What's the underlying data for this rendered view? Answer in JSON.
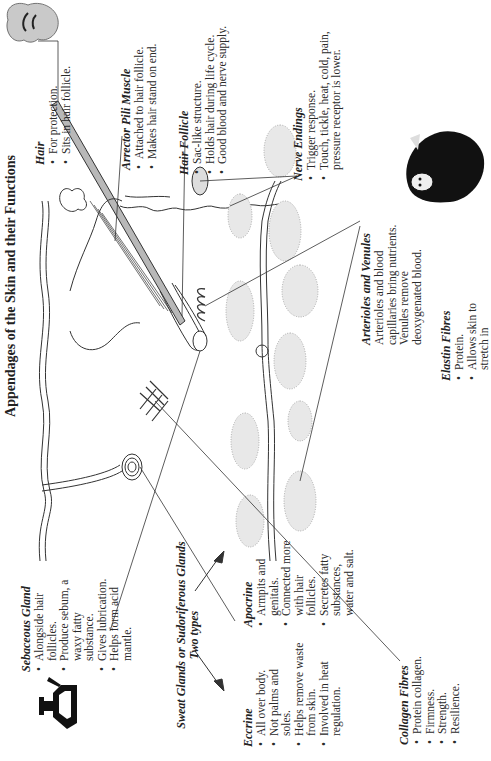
{
  "title": "Appendages of the Skin and their Functions",
  "labels": {
    "hair": {
      "heading": "Hair",
      "bullets": [
        "For protection.",
        "Sits in hair follicle."
      ]
    },
    "arrector_pili": {
      "heading": "Arrector Pili Muscle",
      "bullets": [
        "Attached to hair follicle.",
        "Makes hair stand on end."
      ]
    },
    "hair_follicle": {
      "heading": "Hair Follicle",
      "bullets": [
        "Sac-like structure.",
        "Holds hair during life cycle.",
        "Good blood and nerve supply."
      ]
    },
    "nerve_endings": {
      "heading": "Nerve Endings",
      "bullets": [
        "Trigger response.",
        "Touch, tickle, heat, cold, pain, pressure receptor is lower."
      ]
    },
    "arterioles": {
      "heading": "Arterioles and Venules",
      "text": "Arterioles and blood capillaries bring nutrients. Venules remove deoxygenated blood."
    },
    "elastin": {
      "heading": "Elastin Fibres",
      "bullets": [
        "Protein.",
        "Allows skin to stretch in"
      ]
    },
    "collagen": {
      "heading": "Collagen Fibres",
      "bullets": [
        "Protein collagen.",
        "Firmness.",
        "Strength.",
        "Resilience."
      ]
    },
    "sebaceous": {
      "heading": "Sebaceous Gland",
      "bullets": [
        "Alongside hair follicles.",
        "Produce sebum, a waxy fatty substance.",
        "Gives lubrication.",
        "Helps form acid mantle."
      ]
    },
    "sweat": {
      "heading": "Sweat Glands or Sudoriferous Glands",
      "subheading": "Two types"
    },
    "eccrine": {
      "heading": "Eccrine",
      "bullets": [
        "All over body.",
        "Not palms and soles.",
        "Helps remove waste from skin.",
        "Involved in heat regulation."
      ]
    },
    "apocrine": {
      "heading": "Apocrine",
      "bullets": [
        "Armpits and genitals.",
        "Connected more with hair follicles.",
        "Secretes fatty substances, water and salt."
      ]
    }
  },
  "icons": {
    "hair_illustration": "woman-hair-icon",
    "dark_figure": "cloaked-figure-icon",
    "sebaceous_icon": "oil-can-icon"
  },
  "colors": {
    "line": "#333333",
    "hair_fill": "#b8b8b8",
    "stipple": "#9a9a9a",
    "hair_icon_fill": "#c9c9c9"
  }
}
